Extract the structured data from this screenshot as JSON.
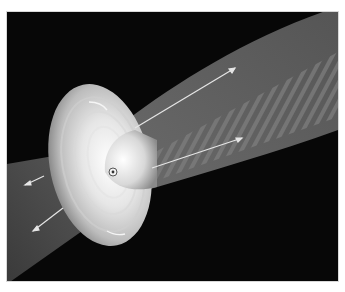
{
  "image": {
    "subject": "accretion-disk-with-bipolar-jets",
    "style": "grayscale illustration",
    "colors": {
      "background": "#070707",
      "jet": "#5a5a5a",
      "jet_stripes": "#7a7a7a",
      "disk_bright": "#f4f4f4",
      "disk_edge": "#9a9a9a",
      "arrow": "#e6e6e6",
      "border": "#d8d8d8"
    },
    "arrows": [
      {
        "x1": 128,
        "y1": 116,
        "x2": 228,
        "y2": 56,
        "direction": "outflow-upper"
      },
      {
        "x1": 145,
        "y1": 156,
        "x2": 235,
        "y2": 126,
        "direction": "outflow-upper"
      },
      {
        "x1": 37,
        "y1": 164,
        "x2": 18,
        "y2": 173,
        "direction": "outflow-lower"
      },
      {
        "x1": 56,
        "y1": 196,
        "x2": 26,
        "y2": 219,
        "direction": "outflow-lower"
      }
    ]
  }
}
